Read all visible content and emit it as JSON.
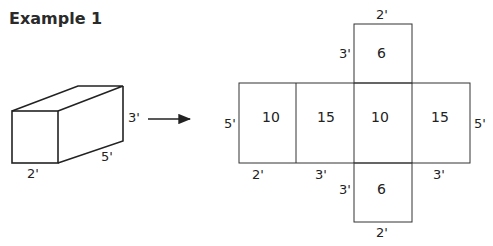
{
  "title": "Example 1",
  "prism": {
    "labels": {
      "height": "3'",
      "width": "2'",
      "length": "5'"
    }
  },
  "net": {
    "top_face": {
      "area": "6",
      "width_label": "2'",
      "height_label": "3'"
    },
    "middle_row": [
      {
        "area": "10"
      },
      {
        "area": "15"
      },
      {
        "area": "10"
      },
      {
        "area": "15"
      }
    ],
    "side_labels": {
      "left": "5'",
      "right": "5'"
    },
    "bottom_labels": [
      "2'",
      "3'",
      "3'"
    ],
    "bottom_face": {
      "area": "6",
      "width_label": "2'",
      "height_label": "3'"
    }
  }
}
